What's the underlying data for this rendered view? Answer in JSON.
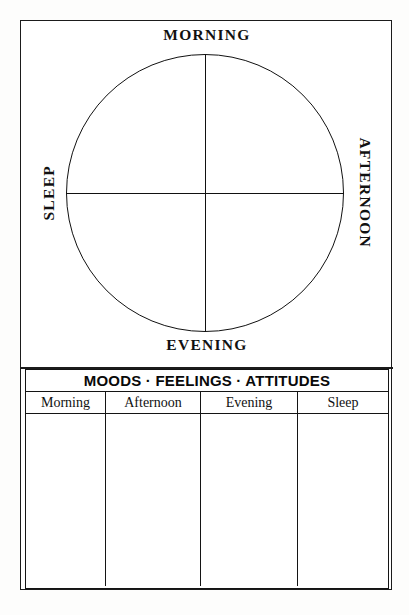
{
  "worksheet": {
    "wheel": {
      "name": "daily-quadrant-wheel",
      "labels": {
        "top": "MORNING",
        "right": "AFTERNOON",
        "bottom": "EVENING",
        "left": "SLEEP"
      }
    },
    "table": {
      "title": "MOODS · FEELINGS · ATTITUDES",
      "columns": [
        {
          "label": "Morning"
        },
        {
          "label": "Afternoon"
        },
        {
          "label": "Evening"
        },
        {
          "label": "Sleep"
        }
      ],
      "rows": [
        {
          "cells": [
            "",
            "",
            "",
            ""
          ]
        }
      ]
    }
  },
  "colors": {
    "ink": "#111111",
    "frame": "#1b1b1b",
    "paper": "#ffffff"
  }
}
